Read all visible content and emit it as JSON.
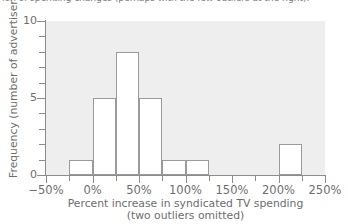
{
  "top_caption": "ion of spending changes (perhaps with the few outliers at the right).",
  "chart_data": {
    "type": "bar",
    "subtype": "histogram",
    "title": "",
    "xlabel": "Percent increase in syndicated TV spending",
    "xlabel_line2": "(two outliers omitted)",
    "ylabel": "Frequency (number of advertisers)",
    "xlim": [
      -50,
      250
    ],
    "ylim": [
      0,
      10
    ],
    "bin_width": 25,
    "grid": false,
    "legend": null,
    "plot_background": "#eeeeee",
    "bar_fill": "#ffffff",
    "bar_edge": "#9a9a9a",
    "axis_color": "#8c8c8c",
    "x_tick_labels": [
      "−50%",
      "0%",
      "50%",
      "100%",
      "150%",
      "200%",
      "250%"
    ],
    "x_tick_values": [
      -50,
      0,
      50,
      100,
      150,
      200,
      250
    ],
    "x_minor_tick_values": [
      -25,
      25,
      75,
      125,
      175,
      225
    ],
    "y_tick_labels": [
      "0",
      "5",
      "10"
    ],
    "y_tick_values": [
      0,
      5,
      10
    ],
    "y_minor_tick_values": [
      1,
      2,
      3,
      4,
      6,
      7,
      8,
      9
    ],
    "bins": [
      {
        "start": -50,
        "end": -25,
        "value": 0
      },
      {
        "start": -25,
        "end": 0,
        "value": 1
      },
      {
        "start": 0,
        "end": 25,
        "value": 5
      },
      {
        "start": 25,
        "end": 50,
        "value": 8
      },
      {
        "start": 50,
        "end": 75,
        "value": 5
      },
      {
        "start": 75,
        "end": 100,
        "value": 1
      },
      {
        "start": 100,
        "end": 125,
        "value": 1
      },
      {
        "start": 125,
        "end": 150,
        "value": 0
      },
      {
        "start": 150,
        "end": 175,
        "value": 0
      },
      {
        "start": 175,
        "end": 200,
        "value": 0
      },
      {
        "start": 200,
        "end": 225,
        "value": 2
      },
      {
        "start": 225,
        "end": 250,
        "value": 0
      }
    ],
    "categories": [
      "-50 to -25",
      "-25 to 0",
      "0 to 25",
      "25 to 50",
      "50 to 75",
      "75 to 100",
      "100 to 125",
      "125 to 150",
      "150 to 175",
      "175 to 200",
      "200 to 225",
      "225 to 250"
    ],
    "values": [
      0,
      1,
      5,
      8,
      5,
      1,
      1,
      0,
      0,
      0,
      2,
      0
    ]
  }
}
